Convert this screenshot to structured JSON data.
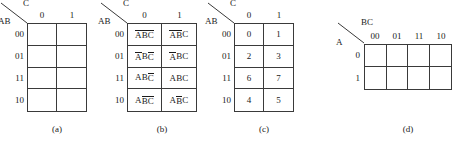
{
  "figure": {
    "type": "karnaugh-maps",
    "ink_color": "#3a3a3a",
    "text_color": "#1a1a1a",
    "background": "#ffffff"
  },
  "panels": [
    {
      "id": "a",
      "caption": "(a)",
      "col_variable": "C",
      "row_variable": "AB",
      "col_headers": [
        "0",
        "1"
      ],
      "row_labels": [
        "00",
        "01",
        "11",
        "10"
      ],
      "cells": [
        [
          "",
          ""
        ],
        [
          "",
          ""
        ],
        [
          "",
          ""
        ],
        [
          "",
          ""
        ]
      ]
    },
    {
      "id": "b",
      "caption": "(b)",
      "col_variable": "C",
      "row_variable": "AB",
      "col_headers": [
        "0",
        "1"
      ],
      "row_labels": [
        "00",
        "01",
        "11",
        "10"
      ],
      "cells": [
        [
          [
            {
              "t": "A",
              "bar": true
            },
            {
              "t": "B",
              "bar": true
            },
            {
              "t": "C",
              "bar": true
            }
          ],
          [
            {
              "t": "A",
              "bar": true
            },
            {
              "t": "B",
              "bar": true
            },
            {
              "t": "C",
              "bar": false
            }
          ]
        ],
        [
          [
            {
              "t": "A",
              "bar": true
            },
            {
              "t": "B",
              "bar": false
            },
            {
              "t": "C",
              "bar": true
            }
          ],
          [
            {
              "t": "A",
              "bar": true
            },
            {
              "t": "B",
              "bar": false
            },
            {
              "t": "C",
              "bar": false
            }
          ]
        ],
        [
          [
            {
              "t": "A",
              "bar": false
            },
            {
              "t": "B",
              "bar": false
            },
            {
              "t": "C",
              "bar": true
            }
          ],
          [
            {
              "t": "A",
              "bar": false
            },
            {
              "t": "B",
              "bar": false
            },
            {
              "t": "C",
              "bar": false
            }
          ]
        ],
        [
          [
            {
              "t": "A",
              "bar": false
            },
            {
              "t": "B",
              "bar": true
            },
            {
              "t": "C",
              "bar": true
            }
          ],
          [
            {
              "t": "A",
              "bar": false
            },
            {
              "t": "B",
              "bar": true
            },
            {
              "t": "C",
              "bar": false
            }
          ]
        ]
      ]
    },
    {
      "id": "c",
      "caption": "(c)",
      "col_variable": "C",
      "row_variable": "AB",
      "col_headers": [
        "0",
        "1"
      ],
      "row_labels": [
        "00",
        "01",
        "11",
        "10"
      ],
      "cells": [
        [
          "0",
          "1"
        ],
        [
          "2",
          "3"
        ],
        [
          "6",
          "7"
        ],
        [
          "4",
          "5"
        ]
      ]
    },
    {
      "id": "d",
      "caption": "(d)",
      "col_variable": "BC",
      "row_variable": "A",
      "col_headers": [
        "00",
        "01",
        "11",
        "10"
      ],
      "row_labels": [
        "0",
        "1"
      ],
      "cells": [
        [
          "",
          "",
          "",
          ""
        ],
        [
          "",
          "",
          "",
          ""
        ]
      ]
    }
  ]
}
